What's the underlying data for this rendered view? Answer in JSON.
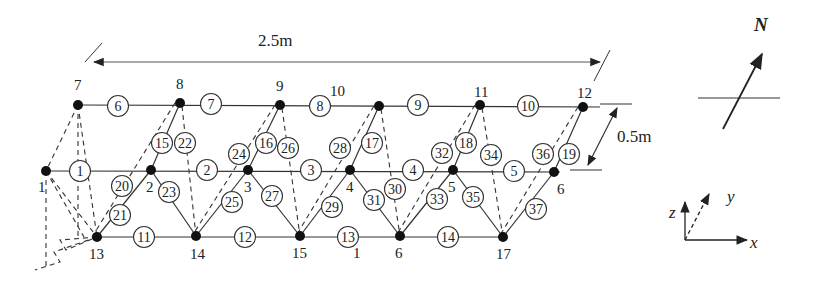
{
  "diagram": {
    "type": "truss-structure-schematic",
    "colors": {
      "line": "#333333",
      "node": "#111111",
      "background": "#ffffff"
    },
    "dimensions": {
      "length": {
        "label": "2.5m"
      },
      "width": {
        "label": "0.5m"
      }
    },
    "north_indicator": {
      "label": "N"
    },
    "axes": {
      "x": "x",
      "y": "y",
      "z": "z"
    },
    "nodes": [
      {
        "id": "1",
        "label": "1",
        "x": 46,
        "y": 171,
        "lx": 38,
        "ly": 192
      },
      {
        "id": "2",
        "label": "2",
        "x": 151,
        "y": 170,
        "lx": 146,
        "ly": 192
      },
      {
        "id": "3",
        "label": "3",
        "x": 248,
        "y": 170,
        "lx": 244,
        "ly": 192
      },
      {
        "id": "4",
        "label": "4",
        "x": 350,
        "y": 170,
        "lx": 346,
        "ly": 192
      },
      {
        "id": "5",
        "label": "5",
        "x": 453,
        "y": 170,
        "lx": 448,
        "ly": 192
      },
      {
        "id": "6",
        "label": "6",
        "x": 554,
        "y": 172,
        "lx": 557,
        "ly": 194
      },
      {
        "id": "7",
        "label": "7",
        "x": 78,
        "y": 105,
        "lx": 74,
        "ly": 90
      },
      {
        "id": "8",
        "label": "8",
        "x": 180,
        "y": 103,
        "lx": 176,
        "ly": 89
      },
      {
        "id": "9",
        "label": "9",
        "x": 280,
        "y": 105,
        "lx": 276,
        "ly": 91
      },
      {
        "id": "10",
        "label": "10",
        "x": 379,
        "y": 106,
        "lx": 330,
        "ly": 96
      },
      {
        "id": "11",
        "label": "11",
        "x": 480,
        "y": 105,
        "lx": 474,
        "ly": 97
      },
      {
        "id": "12",
        "label": "12",
        "x": 583,
        "y": 107,
        "lx": 577,
        "ly": 98
      },
      {
        "id": "13",
        "label": "13",
        "x": 97,
        "y": 237,
        "lx": 89,
        "ly": 259
      },
      {
        "id": "14",
        "label": "14",
        "x": 196,
        "y": 236,
        "lx": 190,
        "ly": 259
      },
      {
        "id": "15",
        "label": "15",
        "x": 300,
        "y": 236,
        "lx": 292,
        "ly": 258
      },
      {
        "id": "16",
        "label": "1",
        "x": 400,
        "y": 236,
        "lx": 353,
        "ly": 258
      },
      {
        "id": "16b",
        "label": "6",
        "x": 400,
        "y": 236,
        "lx": 395,
        "ly": 258
      },
      {
        "id": "17",
        "label": "17",
        "x": 503,
        "y": 237,
        "lx": 496,
        "ly": 259
      }
    ],
    "members": [
      {
        "id": "1",
        "label": "1",
        "cx": 80,
        "cy": 171
      },
      {
        "id": "2",
        "label": "2",
        "cx": 207,
        "cy": 170
      },
      {
        "id": "3",
        "label": "3",
        "cx": 311,
        "cy": 170
      },
      {
        "id": "4",
        "label": "4",
        "cx": 413,
        "cy": 170
      },
      {
        "id": "5",
        "label": "5",
        "cx": 514,
        "cy": 171
      },
      {
        "id": "6",
        "label": "6",
        "cx": 118,
        "cy": 106
      },
      {
        "id": "7",
        "label": "7",
        "cx": 211,
        "cy": 104
      },
      {
        "id": "8",
        "label": "8",
        "cx": 320,
        "cy": 106
      },
      {
        "id": "9",
        "label": "9",
        "cx": 418,
        "cy": 105
      },
      {
        "id": "10",
        "label": "10",
        "cx": 528,
        "cy": 106
      },
      {
        "id": "11",
        "label": "11",
        "cx": 144,
        "cy": 237
      },
      {
        "id": "12",
        "label": "12",
        "cx": 245,
        "cy": 237
      },
      {
        "id": "13",
        "label": "13",
        "cx": 348,
        "cy": 237
      },
      {
        "id": "14",
        "label": "14",
        "cx": 448,
        "cy": 237
      },
      {
        "id": "15",
        "label": "15",
        "cx": 162,
        "cy": 143
      },
      {
        "id": "16",
        "label": "16",
        "cx": 266,
        "cy": 143
      },
      {
        "id": "17",
        "label": "17",
        "cx": 372,
        "cy": 143
      },
      {
        "id": "18",
        "label": "18",
        "cx": 466,
        "cy": 143
      },
      {
        "id": "19",
        "label": "19",
        "cx": 569,
        "cy": 154
      },
      {
        "id": "20",
        "label": "20",
        "cx": 122,
        "cy": 186
      },
      {
        "id": "21",
        "label": "21",
        "cx": 120,
        "cy": 215
      },
      {
        "id": "22",
        "label": "22",
        "cx": 185,
        "cy": 143
      },
      {
        "id": "23",
        "label": "23",
        "cx": 169,
        "cy": 192
      },
      {
        "id": "24",
        "label": "24",
        "cx": 239,
        "cy": 154
      },
      {
        "id": "25",
        "label": "25",
        "cx": 232,
        "cy": 202
      },
      {
        "id": "26",
        "label": "26",
        "cx": 288,
        "cy": 148
      },
      {
        "id": "27",
        "label": "27",
        "cx": 272,
        "cy": 196
      },
      {
        "id": "28",
        "label": "28",
        "cx": 340,
        "cy": 148
      },
      {
        "id": "29",
        "label": "29",
        "cx": 332,
        "cy": 207
      },
      {
        "id": "30",
        "label": "30",
        "cx": 395,
        "cy": 189
      },
      {
        "id": "31",
        "label": "31",
        "cx": 374,
        "cy": 200
      },
      {
        "id": "32",
        "label": "32",
        "cx": 442,
        "cy": 153
      },
      {
        "id": "33",
        "label": "33",
        "cx": 437,
        "cy": 199
      },
      {
        "id": "34",
        "label": "34",
        "cx": 491,
        "cy": 155
      },
      {
        "id": "35",
        "label": "35",
        "cx": 473,
        "cy": 197
      },
      {
        "id": "36",
        "label": "36",
        "cx": 543,
        "cy": 154
      },
      {
        "id": "37",
        "label": "37",
        "cx": 536,
        "cy": 209
      }
    ]
  }
}
